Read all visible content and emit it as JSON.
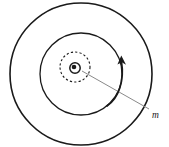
{
  "figure": {
    "background_color": "#ffffff",
    "stroke_color": "#1a1a1a",
    "leader_color": "#808080",
    "canvas": {
      "width": 169,
      "height": 147
    }
  },
  "labels": {
    "mass_label": "m"
  },
  "elements": {
    "outer_circle": {
      "name": "outer-orbit-circle",
      "cx": 81,
      "cy": 74,
      "r": 71,
      "stroke_width": 1.6,
      "dashed": false
    },
    "middle_circle": {
      "name": "middle-orbit-circle",
      "cx": 81,
      "cy": 74,
      "r": 41,
      "stroke_width": 1.3,
      "dashed": false
    },
    "dashed_circle": {
      "name": "dashed-orbit-circle",
      "cx": 75,
      "cy": 67,
      "r": 15,
      "stroke_width": 1.1,
      "dashed": true,
      "dash_pattern": "2.2 2.2"
    },
    "core_circle": {
      "name": "central-body-circle",
      "cx": 75,
      "cy": 68,
      "r": 5.2,
      "stroke_width": 1.4
    },
    "core_dot": {
      "name": "central-body-dot",
      "cx": 74,
      "cy": 67,
      "r": 2.3,
      "fill": "#1a1a1a"
    },
    "rotation_arrow": {
      "name": "rotation-direction-arrow",
      "path": "M 107 106 C 119 98 124 80 121.5 61",
      "stroke_width": 1.6,
      "arrow_tip": {
        "x": 121,
        "y": 56
      }
    },
    "leader_line": {
      "name": "mass-leader-line",
      "x1": 82,
      "y1": 71,
      "x2": 149,
      "y2": 109,
      "stroke_width": 1.0
    },
    "mass_label_position": {
      "x": 152,
      "y": 118
    }
  }
}
